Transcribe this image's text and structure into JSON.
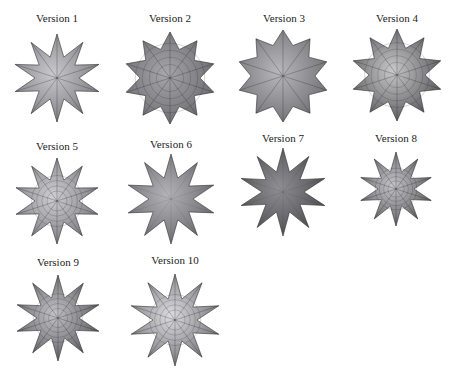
{
  "figure": {
    "items": [
      {
        "label": "Version 1",
        "style": "stellated-faceted",
        "cx": 57,
        "cy": 78,
        "label_x": 57,
        "label_y": 20,
        "r_outer": 44,
        "r_inner": 22,
        "points": 10,
        "fill": "#7d7d82",
        "shade": "#c9c9cc"
      },
      {
        "label": "Version 2",
        "style": "mesh-wireframe",
        "cx": 170,
        "cy": 78,
        "label_x": 170,
        "label_y": 20,
        "r_outer": 46,
        "r_inner": 30,
        "points": 10,
        "fill": "#6b6b70",
        "shade": "#a7a7ab"
      },
      {
        "label": "Version 3",
        "style": "faceted-triangles",
        "cx": 283,
        "cy": 76,
        "label_x": 284,
        "label_y": 20,
        "r_outer": 46,
        "r_inner": 32,
        "points": 10,
        "fill": "#727276",
        "shade": "#b8b8bb"
      },
      {
        "label": "Version 4",
        "style": "spiked-wireframe",
        "cx": 397,
        "cy": 75,
        "label_x": 397,
        "label_y": 20,
        "r_outer": 46,
        "r_inner": 28,
        "points": 10,
        "fill": "#5a5a5e",
        "shade": "#c8c8ca"
      },
      {
        "label": "Version 5",
        "style": "textured-spiky",
        "cx": 57,
        "cy": 201,
        "label_x": 57,
        "label_y": 148,
        "r_outer": 43,
        "r_inner": 22,
        "points": 10,
        "fill": "#7a7a80",
        "shade": "#cfcfd3"
      },
      {
        "label": "Version 6",
        "style": "smooth-spiky",
        "cx": 171,
        "cy": 199,
        "label_x": 171,
        "label_y": 146,
        "r_outer": 45,
        "r_inner": 22,
        "points": 10,
        "fill": "#6a6a6f",
        "shade": "#b3b3b7"
      },
      {
        "label": "Version 7",
        "style": "dark-smooth-spiky",
        "cx": 283,
        "cy": 192,
        "label_x": 283,
        "label_y": 140,
        "r_outer": 44,
        "r_inner": 21,
        "points": 10,
        "fill": "#4e4e52",
        "shade": "#8f8f93"
      },
      {
        "label": "Version 8",
        "style": "small-textured-spiky",
        "cx": 396,
        "cy": 189,
        "label_x": 396,
        "label_y": 140,
        "r_outer": 37,
        "r_inner": 18,
        "points": 10,
        "fill": "#5f5f64",
        "shade": "#c4c4c8"
      },
      {
        "label": "Version 9",
        "style": "textured-spiky",
        "cx": 58,
        "cy": 318,
        "label_x": 58,
        "label_y": 264,
        "r_outer": 43,
        "r_inner": 21,
        "points": 10,
        "fill": "#5d5d62",
        "shade": "#c2c2c6"
      },
      {
        "label": "Version 10",
        "style": "light-textured-spiky",
        "cx": 175,
        "cy": 320,
        "label_x": 175,
        "label_y": 262,
        "r_outer": 46,
        "r_inner": 22,
        "points": 10,
        "fill": "#747479",
        "shade": "#dcdce0"
      }
    ]
  }
}
